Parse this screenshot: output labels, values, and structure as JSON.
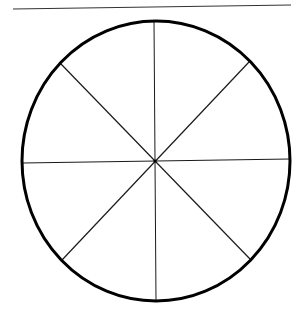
{
  "diagram": {
    "type": "circle-divided-into-eight-sections",
    "sections": 8,
    "colors": {
      "background": "#ffffff",
      "stroke": "#000000",
      "divider": "#1a1a1a",
      "top_rule": "#333333"
    },
    "top_rule": {
      "x1": 13,
      "y1": 9,
      "x2": 291,
      "y2": 5
    },
    "circle": {
      "cx": 156,
      "cy": 161,
      "rx": 134,
      "ry": 140
    },
    "dividers": [
      {
        "name": "vertical",
        "x1": 154,
        "y1": 21,
        "x2": 156,
        "y2": 301
      },
      {
        "name": "horizontal",
        "x1": 22,
        "y1": 163,
        "x2": 290,
        "y2": 159
      },
      {
        "name": "diagonal-tl-br",
        "x1": 61,
        "y1": 64,
        "x2": 250,
        "y2": 259
      },
      {
        "name": "diagonal-tr-bl",
        "x1": 249,
        "y1": 62,
        "x2": 62,
        "y2": 260
      }
    ]
  }
}
